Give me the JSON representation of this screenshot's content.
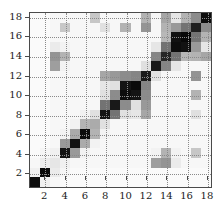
{
  "figure": {
    "kind": "matrix-heatmap",
    "background": "#ffffff",
    "axis_color": "#4a4a4a",
    "grid_color": "#8a8a8a"
  },
  "chart_data": {
    "type": "heatmap",
    "title": "",
    "xlabel": "",
    "ylabel": "",
    "colormap": "grayscale-inverted",
    "colormap_low_color": "#ffffff",
    "colormap_high_color": "#000000",
    "vmin": 0,
    "vmax": 1,
    "grid": true,
    "grid_style": "dotted",
    "grid_interval": 2,
    "legend": "none",
    "symmetric": true,
    "n_rows": 18,
    "n_cols": 18,
    "x": [
      1,
      2,
      3,
      4,
      5,
      6,
      7,
      8,
      9,
      10,
      11,
      12,
      13,
      14,
      15,
      16,
      17,
      18
    ],
    "y": [
      1,
      2,
      3,
      4,
      5,
      6,
      7,
      8,
      9,
      10,
      11,
      12,
      13,
      14,
      15,
      16,
      17,
      18
    ],
    "xticklabels": [
      "2",
      "4",
      "6",
      "8",
      "10",
      "12",
      "14",
      "16",
      "18"
    ],
    "yticklabels": [
      "2",
      "4",
      "6",
      "8",
      "10",
      "12",
      "14",
      "16",
      "18"
    ],
    "xticks": [
      2,
      4,
      6,
      8,
      10,
      12,
      14,
      16,
      18
    ],
    "yticks": [
      2,
      4,
      6,
      8,
      10,
      12,
      14,
      16,
      18
    ],
    "xlim": [
      0.5,
      18.5
    ],
    "ylim": [
      0.5,
      18.5
    ],
    "values": [
      [
        0.95,
        0.06,
        0.03,
        0.02,
        0.02,
        0.02,
        0.02,
        0.02,
        0.02,
        0.02,
        0.02,
        0.02,
        0.02,
        0.02,
        0.02,
        0.02,
        0.02,
        0.02
      ],
      [
        0.06,
        0.97,
        0.08,
        0.04,
        0.02,
        0.02,
        0.02,
        0.02,
        0.02,
        0.02,
        0.02,
        0.02,
        0.02,
        0.02,
        0.02,
        0.02,
        0.02,
        0.02
      ],
      [
        0.03,
        0.08,
        0.1,
        0.06,
        0.03,
        0.03,
        0.03,
        0.03,
        0.03,
        0.03,
        0.03,
        0.03,
        0.38,
        0.42,
        0.08,
        0.03,
        0.03,
        0.03
      ],
      [
        0.02,
        0.04,
        0.06,
        0.92,
        0.4,
        0.05,
        0.03,
        0.03,
        0.03,
        0.03,
        0.03,
        0.03,
        0.05,
        0.3,
        0.05,
        0.03,
        0.22,
        0.03
      ],
      [
        0.02,
        0.02,
        0.03,
        0.4,
        0.93,
        0.33,
        0.05,
        0.03,
        0.03,
        0.03,
        0.03,
        0.03,
        0.03,
        0.03,
        0.03,
        0.03,
        0.03,
        0.03
      ],
      [
        0.02,
        0.02,
        0.03,
        0.05,
        0.33,
        0.96,
        0.3,
        0.05,
        0.03,
        0.03,
        0.03,
        0.03,
        0.03,
        0.03,
        0.03,
        0.03,
        0.03,
        0.03
      ],
      [
        0.02,
        0.02,
        0.03,
        0.03,
        0.05,
        0.3,
        0.33,
        0.12,
        0.03,
        0.03,
        0.03,
        0.03,
        0.03,
        0.03,
        0.03,
        0.03,
        0.03,
        0.03
      ],
      [
        0.02,
        0.02,
        0.03,
        0.03,
        0.03,
        0.05,
        0.12,
        0.93,
        0.55,
        0.12,
        0.1,
        0.35,
        0.03,
        0.03,
        0.03,
        0.03,
        0.12,
        0.03
      ],
      [
        0.02,
        0.02,
        0.03,
        0.03,
        0.03,
        0.03,
        0.03,
        0.55,
        0.9,
        0.45,
        0.12,
        0.4,
        0.03,
        0.03,
        0.03,
        0.03,
        0.03,
        0.03
      ],
      [
        0.02,
        0.02,
        0.03,
        0.03,
        0.03,
        0.03,
        0.03,
        0.12,
        0.45,
        0.95,
        0.92,
        0.45,
        0.03,
        0.03,
        0.03,
        0.03,
        0.3,
        0.03
      ],
      [
        0.02,
        0.02,
        0.03,
        0.03,
        0.03,
        0.03,
        0.03,
        0.1,
        0.12,
        0.92,
        0.96,
        0.48,
        0.03,
        0.03,
        0.03,
        0.03,
        0.03,
        0.03
      ],
      [
        0.02,
        0.02,
        0.03,
        0.03,
        0.03,
        0.03,
        0.03,
        0.35,
        0.4,
        0.45,
        0.48,
        0.9,
        0.12,
        0.03,
        0.03,
        0.03,
        0.42,
        0.03
      ],
      [
        0.02,
        0.02,
        0.38,
        0.05,
        0.03,
        0.03,
        0.03,
        0.03,
        0.03,
        0.03,
        0.03,
        0.12,
        0.9,
        0.48,
        0.1,
        0.03,
        0.03,
        0.03
      ],
      [
        0.02,
        0.02,
        0.42,
        0.3,
        0.03,
        0.03,
        0.03,
        0.03,
        0.03,
        0.03,
        0.03,
        0.03,
        0.48,
        0.85,
        0.55,
        0.28,
        0.3,
        0.35
      ],
      [
        0.02,
        0.02,
        0.08,
        0.05,
        0.03,
        0.03,
        0.03,
        0.03,
        0.03,
        0.03,
        0.03,
        0.03,
        0.1,
        0.55,
        0.95,
        0.93,
        0.4,
        0.1
      ],
      [
        0.02,
        0.02,
        0.03,
        0.03,
        0.03,
        0.03,
        0.03,
        0.03,
        0.03,
        0.03,
        0.03,
        0.03,
        0.03,
        0.28,
        0.93,
        0.97,
        0.55,
        0.3
      ],
      [
        0.02,
        0.02,
        0.03,
        0.22,
        0.03,
        0.03,
        0.03,
        0.12,
        0.03,
        0.3,
        0.03,
        0.42,
        0.03,
        0.3,
        0.4,
        0.55,
        0.88,
        0.45
      ],
      [
        0.02,
        0.02,
        0.03,
        0.03,
        0.03,
        0.03,
        0.22,
        0.03,
        0.03,
        0.03,
        0.03,
        0.3,
        0.03,
        0.35,
        0.1,
        0.3,
        0.45,
        0.95
      ]
    ]
  }
}
